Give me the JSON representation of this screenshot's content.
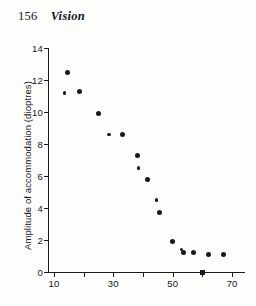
{
  "page": {
    "folio": "156",
    "running_title": "Vision"
  },
  "chart_data": {
    "type": "scatter",
    "title": "",
    "xlabel": "Age (years)",
    "ylabel": "Amplitude of accommodation (dioptres)",
    "xlim": [
      8,
      74
    ],
    "ylim": [
      0,
      14
    ],
    "grid": false,
    "legend": null,
    "x_ticks": [
      10,
      20,
      30,
      40,
      50,
      60,
      70
    ],
    "x_tick_labels": [
      "10",
      "",
      "30",
      "",
      "50",
      "",
      "70"
    ],
    "y_ticks": [
      0,
      2,
      4,
      6,
      8,
      10,
      12,
      14
    ],
    "y_tick_labels": [
      "0",
      "2",
      "4",
      "6",
      "8",
      "10",
      "12",
      "14"
    ],
    "points": [
      {
        "x": 14.5,
        "y": 12.5,
        "marker": "circle"
      },
      {
        "x": 13.5,
        "y": 11.2,
        "marker": "diamond"
      },
      {
        "x": 18.5,
        "y": 11.3,
        "marker": "circle"
      },
      {
        "x": 25.0,
        "y": 9.9,
        "marker": "circle"
      },
      {
        "x": 28.5,
        "y": 8.6,
        "marker": "diamond"
      },
      {
        "x": 33.0,
        "y": 8.6,
        "marker": "circle"
      },
      {
        "x": 38.0,
        "y": 7.3,
        "marker": "circle"
      },
      {
        "x": 38.5,
        "y": 6.5,
        "marker": "diamond"
      },
      {
        "x": 41.5,
        "y": 5.8,
        "marker": "circle"
      },
      {
        "x": 44.5,
        "y": 4.5,
        "marker": "diamond"
      },
      {
        "x": 45.5,
        "y": 3.7,
        "marker": "circle"
      },
      {
        "x": 50.0,
        "y": 1.9,
        "marker": "circle"
      },
      {
        "x": 53.0,
        "y": 1.4,
        "marker": "diamond"
      },
      {
        "x": 53.5,
        "y": 1.2,
        "marker": "circle"
      },
      {
        "x": 57.0,
        "y": 1.2,
        "marker": "circle"
      },
      {
        "x": 62.0,
        "y": 1.1,
        "marker": "circle"
      },
      {
        "x": 67.0,
        "y": 1.1,
        "marker": "circle"
      },
      {
        "x": 60.0,
        "y": 0.0,
        "marker": "square"
      }
    ]
  }
}
